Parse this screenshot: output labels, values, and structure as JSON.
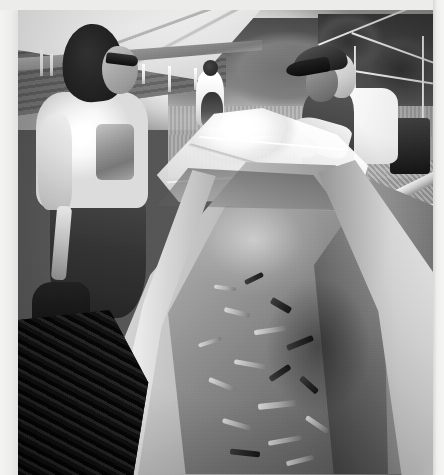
{
  "image": {
    "title": "Dugout canoe carving under a canopy tent",
    "medium": "black-and-white photograph",
    "orientation": "portrait",
    "width_px": 444,
    "height_px": 475,
    "border": {
      "left_width_px": 18,
      "top_width_px": 10,
      "right_width_px": 11,
      "bottom_width_px": 0,
      "color": "#ececeb"
    },
    "photo": {
      "left_px": 18,
      "top_px": 10,
      "width_px": 415,
      "height_px": 465,
      "dominant_colors": [
        "#ffffff",
        "#c6c6c4",
        "#8c8c8a",
        "#4a4a48",
        "#141412"
      ]
    }
  },
  "scene": {
    "setting": "outdoor worksite beneath a white canopy tent on a gravel lot",
    "time_of_day": "bright daylight, blown-out sky toward the centre",
    "subject": "two workers stretching a clear plastic tarp over a large hollowed dugout canoe filled with wood chips",
    "background": "tree line, gravel drive and parked cars visible in the distance"
  },
  "elements": {
    "canopy": {
      "label": "white canopy tent roof",
      "position": "upper left, sloping down to the right",
      "color": "#f4f4f3",
      "details": "seamed fabric panels with hanging tie straps along the lower edge"
    },
    "tent_frame": {
      "label": "metal tent frame poles",
      "position": "upper right against the tree line",
      "color": "#e8e8e6"
    },
    "backdrop": {
      "label": "dark striped tarp backdrop",
      "position": "behind the left worker",
      "color": "#646462"
    },
    "treeline": {
      "label": "dense dark tree line",
      "position": "upper right horizon",
      "color": "#4a4a48"
    },
    "sky": {
      "label": "blown-out bright sky",
      "position": "top centre",
      "color": "#ffffff"
    },
    "ground_drive": {
      "label": "gravel drive",
      "position": "middle distance centre-right",
      "color": "#b0b0ae"
    },
    "vehicles": {
      "label": "parked cars in the distance",
      "count": 3,
      "position": "centre-right middle distance"
    },
    "worker_left": {
      "label": "worker with long dark hair and sunglasses",
      "position": "left foreground",
      "clothing": "light short-sleeved t-shirt with a printed graphic, dark jeans, dark boots",
      "action": "standing beside the canoe holding a wooden-handled tool"
    },
    "worker_right": {
      "label": "older worker in a dark ball cap",
      "position": "right foreground",
      "clothing": "white t-shirt, dark bib overalls, dark trousers",
      "action": "leaning over the gunwale pulling the plastic sheet across the canoe"
    },
    "background_figure": {
      "label": "person in white holding a child",
      "position": "centre middle distance under the tent"
    },
    "tarp": {
      "label": "translucent plastic sheeting",
      "position": "stretched over the bow of the canoe",
      "color": "#fbfbfa"
    },
    "canoe": {
      "label": "large hollowed dugout canoe",
      "position": "dominates the lower two-thirds of the frame, running from upper centre to lower left",
      "material": "pale carved wood",
      "rim_color": "#e6e6e4",
      "cavity_color": "#4f4f4d",
      "contents": "wet wood chips, shavings and debris pooled in the hollowed interior"
    },
    "chip_ground": {
      "label": "heap of dark wood chips and shavings on the ground",
      "position": "bottom left corner",
      "color": "#1a1a18"
    },
    "lumber": {
      "label": "stacked boards and a sawhorse",
      "position": "right edge beyond the canoe",
      "color": "#dcdcda"
    }
  },
  "caption": "Two men stretch a clear plastic sheet over a freshly hollowed dugout canoe under a white canopy tent; wood chips fill the hull and cover the ground."
}
